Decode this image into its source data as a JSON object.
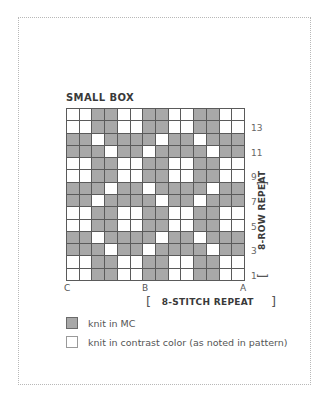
{
  "chart": {
    "title": "SMALL BOX",
    "columns": 14,
    "rows": 14,
    "colors": {
      "mc": "#a8a8a8",
      "contrast": "#ffffff",
      "gridline": "#5a5a5a"
    },
    "grid_top_to_bottom": [
      "WWGGWWGGWWGGWW",
      "WWGGWWGGWWGGWW",
      "GGWGGGGWGGWGGG",
      "GGGWGGWGGGGWGG",
      "WWGGWWGGWWGGWW",
      "WWGGWWGGWWGGWW",
      "GGGWGGWGGGGWGG",
      "GGWGGGGWGGWGGG",
      "WWGGWWGGWWGGWW",
      "WWGGWWGGWWGGWW",
      "GGWGGGGWGGWGGG",
      "GGGWGGWGGGGWGG",
      "WWGGWWGGWWGGWW",
      "WWGGWWGGWWGGWW"
    ],
    "row_numbers": [
      "13",
      "11",
      "9",
      "7",
      "5",
      "3",
      "1"
    ],
    "column_labels": {
      "c": "C",
      "b": "B",
      "a": "A"
    },
    "stitch_repeat": {
      "open": "[",
      "label": "8-STITCH REPEAT",
      "close": "]"
    },
    "row_repeat": {
      "label": "8-ROW REPEAT",
      "open": "[",
      "close": "]"
    }
  },
  "legend": [
    {
      "swatch": "mc",
      "label": "knit in MC"
    },
    {
      "swatch": "contrast",
      "label": "knit in contrast color (as noted in pattern)"
    }
  ]
}
